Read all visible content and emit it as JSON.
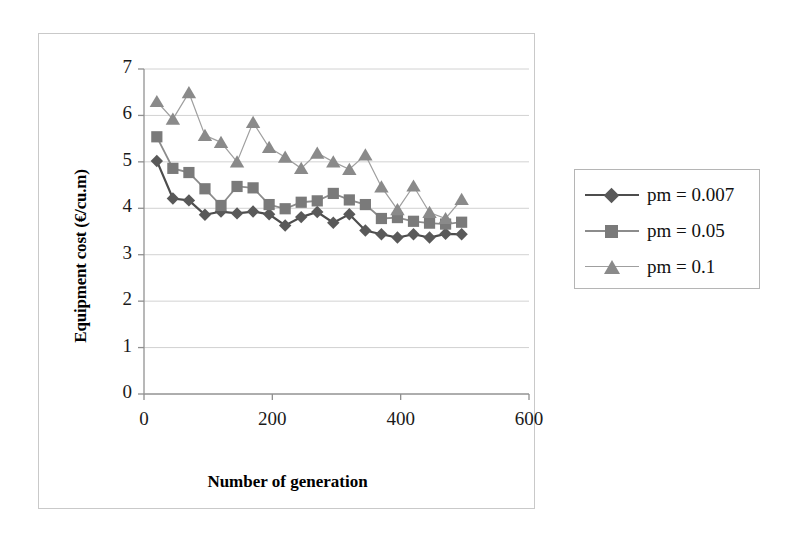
{
  "figure": {
    "background_color": "#ffffff",
    "frame_color": "#c9c9c9"
  },
  "legend": {
    "position": "right",
    "items": [
      {
        "label": "pm = 0.007",
        "marker": "diamond",
        "color": "#595959"
      },
      {
        "label": "pm = 0.05",
        "marker": "square",
        "color": "#7a7a7a"
      },
      {
        "label": "pm = 0.1",
        "marker": "triangle",
        "color": "#8a8a8a"
      }
    ]
  },
  "axes": {
    "x_title": "Number of generation",
    "y_title": "Equipment cost (€/cu.m)",
    "x_ticks": [
      "0",
      "200",
      "400",
      "600"
    ],
    "y_ticks": [
      "0",
      "1",
      "2",
      "3",
      "4",
      "5",
      "6",
      "7"
    ]
  },
  "chart_data": {
    "type": "line",
    "title": "",
    "xlabel": "Number of generation",
    "ylabel": "Equipment cost (€/cu.m)",
    "xlim": [
      0,
      600
    ],
    "ylim": [
      0,
      7
    ],
    "xticks": [
      0,
      200,
      400,
      600
    ],
    "yticks": [
      0,
      1,
      2,
      3,
      4,
      5,
      6,
      7
    ],
    "grid": "horizontal-major",
    "legend_position": "right",
    "x": [
      20,
      45,
      70,
      95,
      120,
      145,
      170,
      195,
      220,
      245,
      270,
      295,
      320,
      345,
      370,
      395,
      420,
      445,
      470,
      495
    ],
    "series": [
      {
        "name": "pm = 0.007",
        "marker": "diamond",
        "color": "#595959",
        "line_color": "#4d4d4d",
        "values": [
          5.02,
          4.21,
          4.17,
          3.86,
          3.93,
          3.89,
          3.93,
          3.87,
          3.63,
          3.81,
          3.92,
          3.69,
          3.87,
          3.52,
          3.44,
          3.37,
          3.44,
          3.37,
          3.45,
          3.44
        ]
      },
      {
        "name": "pm = 0.05",
        "marker": "square",
        "color": "#7a7a7a",
        "line_color": "#8c8c8c",
        "values": [
          5.54,
          4.86,
          4.77,
          4.42,
          4.06,
          4.47,
          4.44,
          4.08,
          3.99,
          4.13,
          4.16,
          4.32,
          4.18,
          4.08,
          3.78,
          3.8,
          3.72,
          3.68,
          3.66,
          3.7
        ]
      },
      {
        "name": "pm = 0.1",
        "marker": "triangle",
        "color": "#8a8a8a",
        "line_color": "#9f9f9f",
        "values": [
          6.3,
          5.92,
          6.49,
          5.57,
          5.42,
          5.0,
          5.85,
          5.31,
          5.1,
          4.86,
          5.19,
          5.0,
          4.84,
          5.15,
          4.46,
          3.97,
          4.48,
          3.91,
          3.78,
          4.19
        ]
      }
    ]
  }
}
